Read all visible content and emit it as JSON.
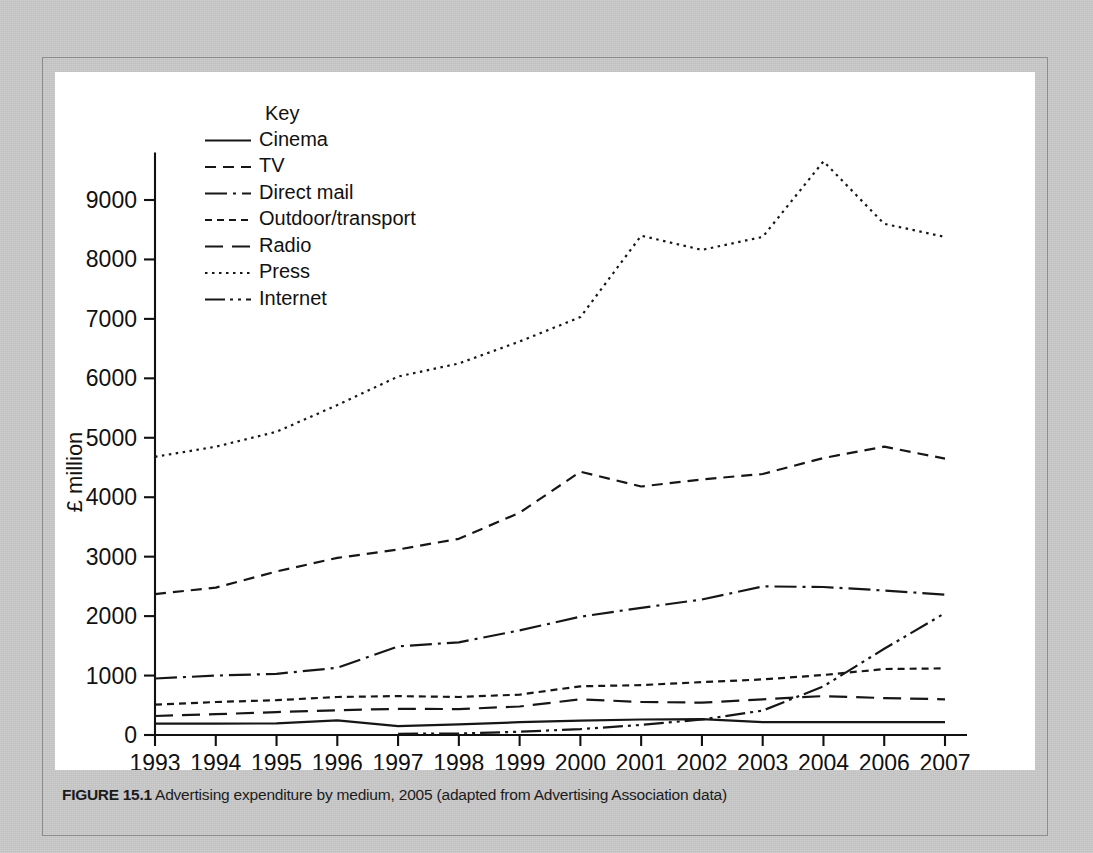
{
  "figure": {
    "caption_label": "FIGURE 15.1",
    "caption_text": "Advertising expenditure by medium, 2005 (adapted from Advertising Association data)"
  },
  "chart_data": {
    "type": "line",
    "title": "",
    "xlabel": "",
    "ylabel": "£ million",
    "legend_title": "Key",
    "legend_position": "inside-top-left",
    "grid": false,
    "xlim": [
      1993,
      2007
    ],
    "ylim": [
      0,
      9800
    ],
    "yticks": [
      0,
      1000,
      2000,
      3000,
      4000,
      5000,
      6000,
      7000,
      8000,
      9000
    ],
    "ytick_labels": [
      "0",
      "1000",
      "2000",
      "3000",
      "4000",
      "5000",
      "6000",
      "7000",
      "8000",
      "9000"
    ],
    "categories": [
      "1993",
      "1994",
      "1995",
      "1996",
      "1997",
      "1998",
      "1999",
      "2000",
      "2001",
      "2002",
      "2003",
      "2004",
      "2006",
      "2007"
    ],
    "series": [
      {
        "name": "Cinema",
        "dash": "solid",
        "dasharray": "none",
        "values": [
          190,
          190,
          195,
          245,
          150,
          180,
          215,
          240,
          260,
          265,
          215,
          215,
          215,
          215
        ]
      },
      {
        "name": "TV",
        "dash": "medium-dash",
        "dasharray": "11,7",
        "values": [
          2370,
          2480,
          2750,
          2980,
          3120,
          3300,
          3740,
          4430,
          4180,
          4300,
          4390,
          4660,
          4850,
          4650
        ]
      },
      {
        "name": "Direct mail",
        "dash": "dash-dot",
        "dasharray": "22,6,3,6",
        "values": [
          950,
          1000,
          1030,
          1130,
          1490,
          1560,
          1760,
          1990,
          2140,
          2280,
          2500,
          2490,
          2430,
          2360
        ]
      },
      {
        "name": "Outdoor/transport",
        "dash": "short-dash",
        "dasharray": "7,5",
        "values": [
          510,
          555,
          585,
          640,
          655,
          640,
          680,
          820,
          840,
          890,
          935,
          1010,
          1110,
          1120
        ]
      },
      {
        "name": "Radio",
        "dash": "long-dash",
        "dasharray": "18,9",
        "values": [
          320,
          350,
          385,
          415,
          440,
          435,
          480,
          600,
          555,
          545,
          600,
          655,
          620,
          600
        ]
      },
      {
        "name": "Press",
        "dash": "dotted",
        "dasharray": "2.5,4.5",
        "values": [
          4680,
          4850,
          5100,
          5550,
          6030,
          6250,
          6620,
          7030,
          8400,
          8160,
          8380,
          9650,
          8600,
          8380
        ]
      },
      {
        "name": "Internet",
        "dash": "dash-dot-dot",
        "dasharray": "20,5,3,5,3,5",
        "values": [
          null,
          null,
          null,
          null,
          20,
          25,
          55,
          100,
          170,
          260,
          410,
          820,
          1450,
          2050
        ]
      }
    ]
  }
}
